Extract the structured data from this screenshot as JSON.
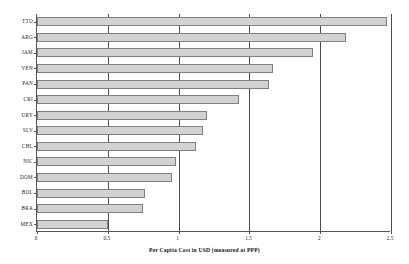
{
  "chart_data": {
    "type": "bar",
    "orientation": "horizontal",
    "title": "",
    "xlabel": "Per Capita Cost in USD (measured at PPP)",
    "ylabel": "",
    "categories": [
      "TTO",
      "ARG",
      "JAM",
      "VEN",
      "PAN",
      "CRI",
      "URY",
      "SLV",
      "CHL",
      "NIC",
      "DOM",
      "BOL",
      "BRA",
      "MEX"
    ],
    "values": [
      2.47,
      2.18,
      1.95,
      1.67,
      1.64,
      1.43,
      1.2,
      1.17,
      1.12,
      0.98,
      0.95,
      0.76,
      0.75,
      0.5
    ],
    "xlim": [
      0,
      2.5
    ],
    "xticks": [
      0,
      0.5,
      1,
      1.5,
      2,
      2.5
    ],
    "xtick_labels": [
      "0",
      "0.5",
      "1",
      "1.5",
      "2",
      "2.5"
    ],
    "grid": true,
    "grid_axis": "x",
    "legend": false,
    "bar_fill_color": "#d2d2d2",
    "bar_edge_color": "#808080",
    "axis_color": "#555555",
    "background_color": "#ffffff"
  }
}
